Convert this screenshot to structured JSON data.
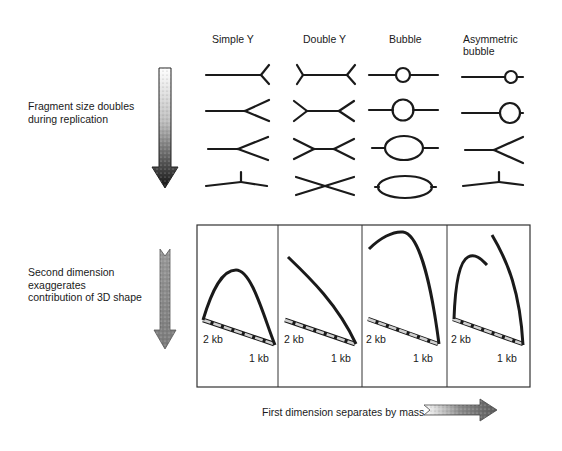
{
  "columns": [
    {
      "label": "Simple Y"
    },
    {
      "label": "Double Y"
    },
    {
      "label": "Bubble"
    },
    {
      "label": "Asymmetric\nbubble",
      "line1": "Asymmetric",
      "line2": "bubble"
    }
  ],
  "top_section": {
    "label_line1": "Fragment size doubles",
    "label_line2": "during replication",
    "arrow": "down-arrow-gradient-icon"
  },
  "bottom_section": {
    "label_line1": "Second dimension",
    "label_line2": "exaggerates",
    "label_line3": "contribution of 3D shape",
    "arrow": "down-arrow-textured-icon"
  },
  "panels": [
    {
      "name": "simple-y",
      "label_2kb": "2 kb",
      "label_1kb": "1 kb"
    },
    {
      "name": "double-y",
      "label_2kb": "2 kb",
      "label_1kb": "1 kb"
    },
    {
      "name": "bubble",
      "label_2kb": "2 kb",
      "label_1kb": "1 kb"
    },
    {
      "name": "asymmetric-bubble",
      "label_2kb": "2 kb",
      "label_1kb": "1 kb"
    }
  ],
  "footer": {
    "label": "First dimension separates by mass",
    "arrow": "right-arrow-textured-icon"
  },
  "colors": {
    "ink": "#1a1a1a",
    "dashed_fill": "#bdbdbd",
    "frame": "#333333"
  }
}
